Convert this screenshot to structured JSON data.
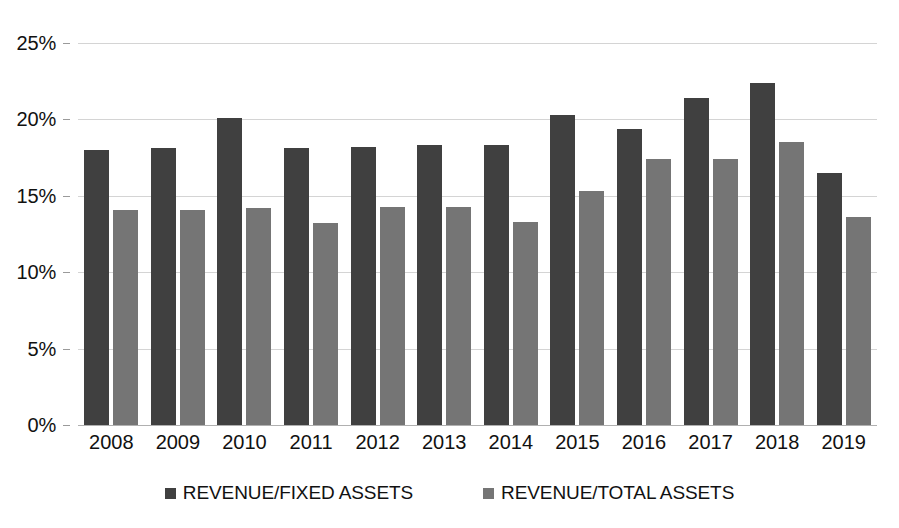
{
  "chart_data": {
    "type": "bar",
    "title": "",
    "xlabel": "",
    "ylabel": "",
    "categories": [
      "2008",
      "2009",
      "2010",
      "2011",
      "2012",
      "2013",
      "2014",
      "2015",
      "2016",
      "2017",
      "2018",
      "2019"
    ],
    "series": [
      {
        "name": "REVENUE/FIXED ASSETS",
        "color": "#404040",
        "values": [
          18.0,
          18.1,
          20.1,
          18.1,
          18.2,
          18.3,
          18.3,
          20.3,
          19.4,
          21.4,
          22.4,
          16.5
        ]
      },
      {
        "name": "REVENUE/TOTAL ASSETS",
        "color": "#757575",
        "values": [
          14.1,
          14.1,
          14.2,
          13.2,
          14.3,
          14.3,
          13.3,
          15.3,
          17.4,
          17.4,
          18.5,
          13.6
        ]
      }
    ],
    "ylim": [
      0,
      25
    ],
    "y_ticks": [
      0,
      5,
      10,
      15,
      20,
      25
    ],
    "y_tick_labels": [
      "0%",
      "5%",
      "10%",
      "15%",
      "20%",
      "25%"
    ],
    "grid": true,
    "legend_position": "bottom"
  }
}
